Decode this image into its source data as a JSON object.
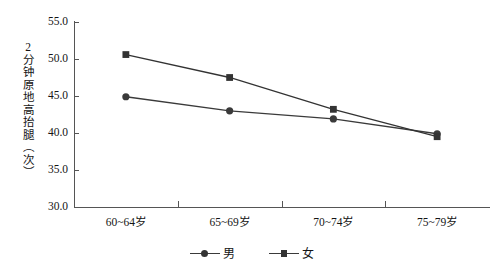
{
  "chart_data": {
    "type": "line",
    "title": "",
    "xlabel": "",
    "ylabel": "2分钟原地高抬腿（次）",
    "categories": [
      "60~64岁",
      "65~69岁",
      "70~74岁",
      "75~79岁"
    ],
    "ylim": [
      30.0,
      55.0
    ],
    "yticks": [
      "30.0",
      "35.0",
      "40.0",
      "45.0",
      "50.0",
      "55.0"
    ],
    "ytick_values": [
      30.0,
      35.0,
      40.0,
      45.0,
      50.0,
      55.0
    ],
    "grid": false,
    "legend_position": "bottom-center",
    "series": [
      {
        "name": "男",
        "marker": "circle",
        "color": "#3a3a3a",
        "values": [
          44.9,
          43.0,
          41.9,
          39.9
        ]
      },
      {
        "name": "女",
        "marker": "square",
        "color": "#333333",
        "values": [
          50.6,
          47.5,
          43.2,
          39.5
        ]
      }
    ]
  },
  "legend": {
    "items": [
      {
        "label": "男",
        "marker": "circle"
      },
      {
        "label": "女",
        "marker": "square"
      }
    ]
  }
}
